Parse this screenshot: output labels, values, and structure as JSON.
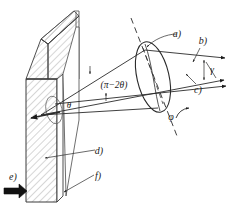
{
  "figure": {
    "background": "#ffffff",
    "ink": "#1a1a1a",
    "hatch_color": "#7a7a7a",
    "width": 230,
    "height": 212
  },
  "labels": {
    "a_top": "a)",
    "b": "b)",
    "c": "c)",
    "d": "d)",
    "e": "e)",
    "f": "f)",
    "gamma": "γ",
    "phi": "φ",
    "theta": "θ",
    "pi_minus_2theta": "(π−2θ)"
  },
  "annotations": [
    {
      "key": "a_top",
      "text": "a)",
      "x": 181,
      "y": 36,
      "role": "lens-callout"
    },
    {
      "key": "b",
      "text": "b)",
      "x": 201,
      "y": 43,
      "role": "upper-ray-callout"
    },
    {
      "key": "c",
      "text": "c)",
      "x": 198,
      "y": 88,
      "role": "axis-ray-callout"
    },
    {
      "key": "gamma",
      "text": "γ",
      "x": 211,
      "y": 69,
      "role": "angle-between-rays"
    },
    {
      "key": "phi",
      "text": "φ",
      "x": 172,
      "y": 118,
      "role": "lens-tilt-angle"
    },
    {
      "key": "theta",
      "text": "θ",
      "x": 69,
      "y": 106,
      "role": "vertex-angle"
    },
    {
      "key": "pi2t",
      "text": "(π−2θ)",
      "x": 95,
      "y": 85,
      "role": "beam-spread-angle"
    },
    {
      "key": "d",
      "text": "d)",
      "x": 97,
      "y": 152,
      "role": "slab-callout"
    },
    {
      "key": "f",
      "text": "f)",
      "x": 96,
      "y": 177,
      "role": "edge-callout"
    },
    {
      "key": "e",
      "text": "e)",
      "x": 12,
      "y": 178,
      "role": "incident-beam"
    }
  ],
  "geometry": {
    "slab": {
      "front_face": "hatched rectangular plate, rotated slightly",
      "top_face": "parallelogram top",
      "side_face": "thin right side face"
    },
    "lens": {
      "type": "ellipse",
      "cx": 153,
      "cy": 77,
      "rx": 16,
      "ry": 35,
      "tilt_deg": -12
    },
    "dashed_axis": {
      "from": [
        131,
        18
      ],
      "to": [
        178,
        135
      ]
    },
    "rays": [
      "upper",
      "lower",
      "horizontal-axis",
      "deflected"
    ]
  }
}
